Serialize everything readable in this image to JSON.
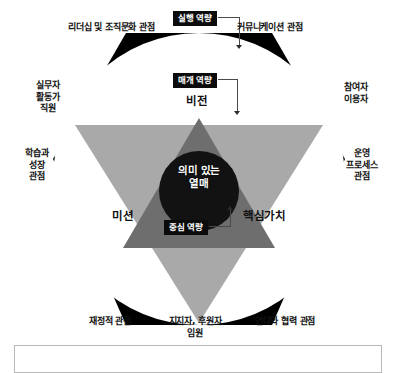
{
  "diagram": {
    "title_hidden": "",
    "colors": {
      "hexagon": "#000000",
      "circle": "#ffffff",
      "down_triangle": "#a9a9a9",
      "up_triangle": "#6e6e6e",
      "core_circle": "#111111",
      "chip_background": "#0b0b0b",
      "chip_text": "#ffffff",
      "connector": "#4a4a4a",
      "caption_border": "#b9b9b9"
    },
    "chips": [
      {
        "id": "execution",
        "label": "실행 역량"
      },
      {
        "id": "mediation",
        "label": "매개 역량"
      },
      {
        "id": "core",
        "label": "중심 역량"
      }
    ],
    "inner_words": [
      {
        "id": "vision",
        "label": "비전"
      },
      {
        "id": "mission",
        "label": "미션"
      },
      {
        "id": "core-values",
        "label": "핵심가치"
      }
    ],
    "core_label": "의미 있는\n열매",
    "perspectives": [
      {
        "id": "leadership-culture",
        "label": "리더십 및 조직문화 관점"
      },
      {
        "id": "communication",
        "label": "커뮤니케이션 관점"
      },
      {
        "id": "learning-growth",
        "label": "학습과\n성장\n관점"
      },
      {
        "id": "operations-process",
        "label": "운영\n프로세스\n관점"
      },
      {
        "id": "financial",
        "label": "재정적 관점"
      },
      {
        "id": "solidarity-cooperation",
        "label": "연대와 협력 관점"
      }
    ],
    "stakeholders": [
      {
        "id": "staff",
        "label": "실무자\n활동가\n직원"
      },
      {
        "id": "participants",
        "label": "참여자\n이용자"
      },
      {
        "id": "supporters",
        "label": "지지자, 후원자\n임원"
      }
    ],
    "caption": ""
  }
}
